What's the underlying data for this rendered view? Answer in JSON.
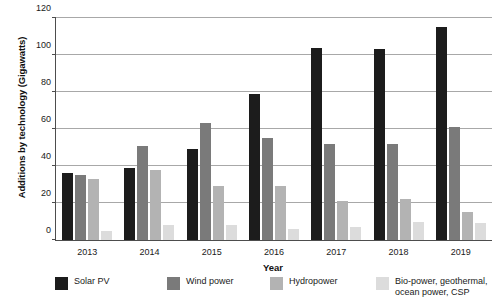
{
  "chart_data": {
    "type": "bar",
    "title": "",
    "xlabel": "Year",
    "ylabel": "Additions by technology (Gigawatts)",
    "categories": [
      "2013",
      "2014",
      "2015",
      "2016",
      "2017",
      "2018",
      "2019"
    ],
    "ylim": [
      0,
      120
    ],
    "yticks": [
      0,
      20,
      40,
      60,
      80,
      100,
      120
    ],
    "grid": true,
    "legend_position": "bottom",
    "series": [
      {
        "name": "Solar PV",
        "color": "#1c1c1c",
        "values": [
          36,
          39,
          49,
          79,
          104,
          103,
          115
        ]
      },
      {
        "name": "Wind power",
        "color": "#7a7a7a",
        "values": [
          35,
          51,
          63,
          55,
          52,
          52,
          61
        ]
      },
      {
        "name": "Hydropower",
        "color": "#b3b3b3",
        "values": [
          33,
          38,
          29,
          29,
          21,
          22,
          15
        ]
      },
      {
        "name": "Bio-power, geothermal, ocean power, CSP",
        "color": "#dcdcdc",
        "values": [
          5,
          8,
          8,
          6,
          7,
          10,
          9
        ]
      }
    ]
  },
  "legend": {
    "items": [
      {
        "label": "Solar PV"
      },
      {
        "label": "Wind power"
      },
      {
        "label": "Hydropower"
      },
      {
        "label_line1": "Bio-power, geothermal,",
        "label_line2": "ocean power, CSP"
      }
    ]
  },
  "axis": {
    "y_tick_labels": [
      "0",
      "20",
      "40",
      "60",
      "80",
      "100",
      "120"
    ],
    "x_tick_labels": [
      "2013",
      "2014",
      "2015",
      "2016",
      "2017",
      "2018",
      "2019"
    ],
    "y_title": "Additions by technology (Gigawatts)",
    "x_title": "Year"
  }
}
